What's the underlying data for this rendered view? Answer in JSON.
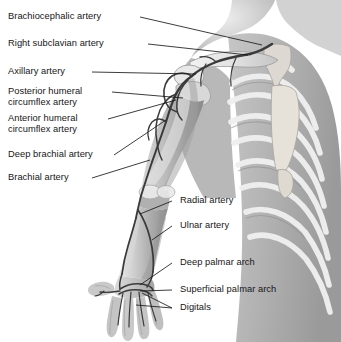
{
  "figure": {
    "style": "grayscale anatomical illustration",
    "background_color": "#ffffff",
    "leader_line_color": "#1a1a1a",
    "text_color": "#161616"
  },
  "labels_left": [
    {
      "id": "brachiocephalic-artery",
      "line1": "Brachiocephalic artery",
      "line2": ""
    },
    {
      "id": "right-subclavian-artery",
      "line1": "Right subclavian artery",
      "line2": ""
    },
    {
      "id": "axillary-artery",
      "line1": "Axillary artery",
      "line2": ""
    },
    {
      "id": "posterior-humeral-circumflex-artery",
      "line1": "Posterior humeral",
      "line2": "circumflex artery"
    },
    {
      "id": "anterior-humeral-circumflex-artery",
      "line1": "Anterior humeral",
      "line2": "circumflex artery"
    },
    {
      "id": "deep-brachial-artery",
      "line1": "Deep brachial artery",
      "line2": ""
    },
    {
      "id": "brachial-artery",
      "line1": "Brachial artery",
      "line2": ""
    }
  ],
  "labels_right": [
    {
      "id": "radial-artery",
      "line1": "Radial artery",
      "line2": ""
    },
    {
      "id": "ulnar-artery",
      "line1": "Ulnar artery",
      "line2": ""
    },
    {
      "id": "deep-palmar-arch",
      "line1": "Deep palmar arch",
      "line2": ""
    },
    {
      "id": "superficial-palmar-arch",
      "line1": "Superficial palmar arch",
      "line2": ""
    },
    {
      "id": "digitals",
      "line1": "Digitals",
      "line2": ""
    }
  ]
}
